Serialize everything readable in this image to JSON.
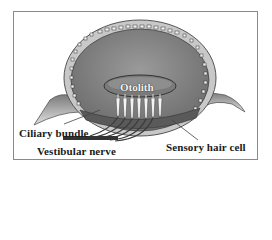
{
  "figure": {
    "labels": {
      "otolith": "Otolith",
      "ciliary_bundle": "Ciliary bundle",
      "vestibular_nerve": "Vestibular nerve",
      "sensory_hair_cell": "Sensory hair cell"
    },
    "colors": {
      "frame": "#8a8a8a",
      "tissue_fill": "#8c8c8c",
      "membrane_rim": "#c8c8c8",
      "otolith_fill": "#7a7a7a",
      "hair_cells": "#f4f4f4",
      "nerve_fibers": "#3a3a3a",
      "label_text": "#1a1a1a"
    }
  }
}
